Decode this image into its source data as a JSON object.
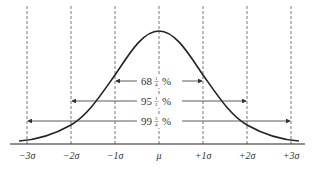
{
  "diagram": {
    "axis_labels": [
      "−3σ",
      "−2σ",
      "−1σ",
      "μ",
      "+1σ",
      "+2σ",
      "+3σ"
    ],
    "intervals": [
      {
        "range": "±1σ",
        "label": "68¼ %",
        "whole": "68",
        "num": "1",
        "den": "4"
      },
      {
        "range": "±2σ",
        "label": "95½ %",
        "whole": "95",
        "num": "1",
        "den": "2"
      },
      {
        "range": "±3σ",
        "label": "99¾ %",
        "whole": "99",
        "num": "3",
        "den": "4"
      }
    ],
    "colors": {
      "line": "#222222",
      "dash": "#555555",
      "text": "#333333"
    }
  }
}
